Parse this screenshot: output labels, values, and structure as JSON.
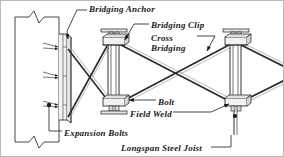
{
  "diagram": {
    "type": "engineering-detail-drawing",
    "labels": {
      "bridging_anchor": "Bridging Anchor",
      "bridging_clip": "Bridging Clip",
      "cross": "Cross",
      "bridging": "Bridging",
      "bolt": "Bolt",
      "field_weld": "Field Weld",
      "expansion_bolts": "Expansion Bolts",
      "longspan_steel_joist": "Longspan Steel Joist"
    },
    "colors": {
      "line": "#1a1a1a",
      "fill_light": "#f2f2f2",
      "fill_mid": "#d8d8d8",
      "background": "#ffffff",
      "border": "#b9b9b9"
    },
    "components": [
      {
        "name": "concrete-wall",
        "description": "Vertical wall section at left with break symbols at top and bottom"
      },
      {
        "name": "bridging-anchor-plate",
        "description": "Angled steel anchor plate fastened to the wall face"
      },
      {
        "name": "expansion-bolts",
        "count": 3,
        "description": "Expansion bolts through anchor plate into wall"
      },
      {
        "name": "joist-left",
        "description": "Longspan steel joist with top and bottom chords"
      },
      {
        "name": "joist-right",
        "description": "Longspan steel joist with top and bottom chords"
      },
      {
        "name": "cross-bridging",
        "description": "Diagonal X-pattern bridging members between joists"
      },
      {
        "name": "bridging-clip",
        "description": "Clip at joist chord receiving bridging members"
      },
      {
        "name": "bolt",
        "description": "Bolted connection at bottom chord bridging clip"
      },
      {
        "name": "field-weld",
        "description": "Field weld at bottom chord connection"
      }
    ]
  }
}
